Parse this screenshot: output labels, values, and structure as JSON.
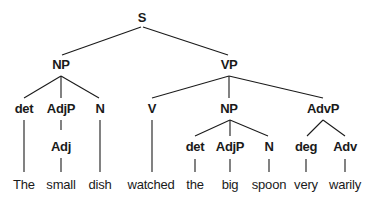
{
  "tree": {
    "root": "S",
    "level1": [
      "NP",
      "VP"
    ],
    "np1_children": [
      "det",
      "AdjP",
      "N"
    ],
    "adjp1_child": "Adj",
    "vp_children": [
      "V",
      "NP",
      "AdvP"
    ],
    "np2_children": [
      "det",
      "AdjP",
      "N"
    ],
    "advp_children": [
      "deg",
      "Adv"
    ],
    "words": [
      "The",
      "small",
      "dish",
      "watched",
      "the",
      "big",
      "spoon",
      "very",
      "warily"
    ]
  }
}
